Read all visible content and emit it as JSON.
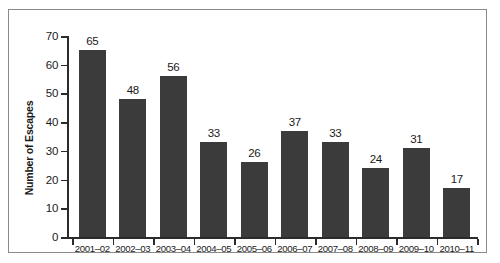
{
  "chart_data": {
    "type": "bar",
    "title": "",
    "subtitle": "",
    "xlabel": "",
    "ylabel": "Number of Escapes",
    "categories": [
      "2001–02",
      "2002–03",
      "2003–04",
      "2004–05",
      "2005–06",
      "2006–07",
      "2007–08",
      "2008–09",
      "2009–10",
      "2010–11"
    ],
    "values": [
      65,
      48,
      56,
      33,
      26,
      37,
      33,
      24,
      31,
      17
    ],
    "data_labels": [
      "65",
      "48",
      "56",
      "33",
      "26",
      "37",
      "33",
      "24",
      "31",
      "17"
    ],
    "ylim": [
      0,
      70
    ],
    "ytick_values": [
      0,
      10,
      20,
      30,
      40,
      50,
      60,
      70
    ],
    "ytick_labels": [
      "0",
      "10",
      "20",
      "30",
      "40",
      "50",
      "60",
      "70"
    ],
    "grid": false,
    "legend": null,
    "legend_position": "none",
    "bar_color": "#3b3b3b",
    "axis_color": "#2b2b2b",
    "frame_color": "#8a8a8a",
    "background_color": "#ffffff",
    "text_color": "#1a1a1a"
  }
}
